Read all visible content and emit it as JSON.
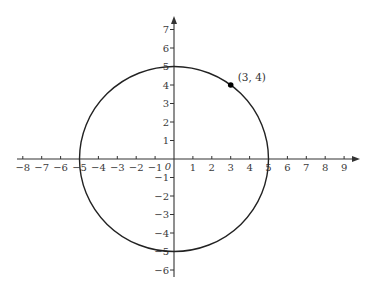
{
  "chart_data": {
    "type": "scatter",
    "title": "",
    "xlabel": "",
    "ylabel": "",
    "grid": false,
    "legend": null,
    "xlim": [
      -8.5,
      9.7
    ],
    "ylim": [
      -6.5,
      7.8
    ],
    "x_ticks": [
      -8,
      -7,
      -6,
      -5,
      -4,
      -3,
      -2,
      -1,
      1,
      2,
      3,
      4,
      5,
      6,
      7,
      8,
      9
    ],
    "y_ticks": [
      -6,
      -5,
      -4,
      -3,
      -2,
      -1,
      1,
      2,
      3,
      4,
      5,
      6,
      7
    ],
    "x_tick_labels": [
      "−8",
      "−7",
      "−6",
      "−5",
      "−4",
      "−3",
      "−2",
      "−1",
      "1",
      "2",
      "3",
      "4",
      "5",
      "6",
      "7",
      "8",
      "9"
    ],
    "y_tick_labels": [
      "−6",
      "−5",
      "−4",
      "−3",
      "−2",
      "−1",
      "1",
      "2",
      "3",
      "4",
      "5",
      "6",
      "7"
    ],
    "origin_label": "0",
    "shapes": [
      {
        "type": "circle",
        "center": [
          0,
          0
        ],
        "radius": 5,
        "color": "#222222"
      }
    ],
    "points": [
      {
        "x": 3,
        "y": 4,
        "label": "(3, 4)",
        "color": "#000000"
      }
    ]
  },
  "style": {
    "axis_color": "#333333",
    "curve_color": "#222222",
    "point_color": "#000000"
  }
}
